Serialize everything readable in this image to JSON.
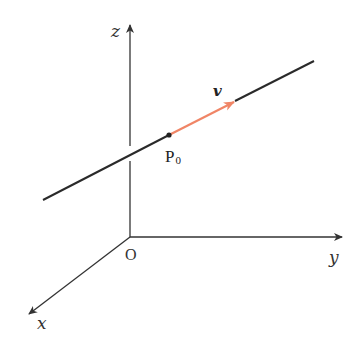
{
  "diagram": {
    "colors": {
      "axis": "#333333",
      "line": "#2a2a2a",
      "vector": "#f08566",
      "point": "#222222"
    },
    "axes": {
      "origin_label": "O",
      "x_label": "x",
      "y_label": "y",
      "z_label": "z"
    },
    "point": {
      "label_main": "P",
      "label_sub": "0"
    },
    "vector": {
      "label": "v"
    }
  }
}
